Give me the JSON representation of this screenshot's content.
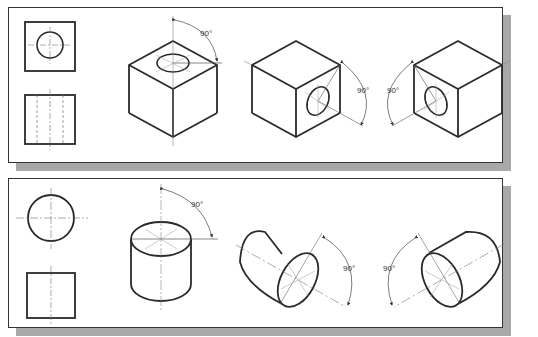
{
  "figure": {
    "panels": [
      {
        "id": "cube-panel",
        "subject": "cube with cylindrical hole",
        "orthographic_views": [
          "top-view-circle-in-square",
          "front-view-hidden-lines"
        ],
        "isometric_views": [
          {
            "orientation": "hole-on-top",
            "angle_label": "90°"
          },
          {
            "orientation": "hole-on-right-face",
            "angle_label": "90°"
          },
          {
            "orientation": "hole-on-left-face",
            "angle_label": "90°"
          }
        ]
      },
      {
        "id": "cylinder-panel",
        "subject": "cylinder",
        "orthographic_views": [
          "top-view-circle",
          "front-view-square"
        ],
        "isometric_views": [
          {
            "orientation": "axis-vertical",
            "angle_label": "90°"
          },
          {
            "orientation": "axis-right",
            "angle_label": "90°"
          },
          {
            "orientation": "axis-left",
            "angle_label": "90°"
          }
        ]
      }
    ],
    "colors": {
      "line": "#2a2a2a",
      "thin": "#666666",
      "shadow": "#a8a8a8",
      "panel": "#ffffff"
    }
  },
  "labels": {
    "a1": "90°",
    "a2": "90°",
    "a3": "90°",
    "b1": "90°",
    "b2": "90°",
    "b3": "90°"
  }
}
